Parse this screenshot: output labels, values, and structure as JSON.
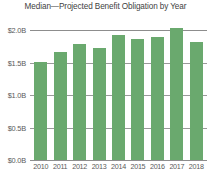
{
  "chart_data": {
    "type": "bar",
    "title": "Median—Projected Benefit Obligation by Year",
    "xlabel": "",
    "ylabel": "",
    "categories": [
      "2010",
      "2011",
      "2012",
      "2013",
      "2014",
      "2015",
      "2016",
      "2017",
      "2018"
    ],
    "values": [
      1.51,
      1.66,
      1.78,
      1.72,
      1.92,
      1.86,
      1.9,
      2.03,
      1.81
    ],
    "value_unit": "B",
    "value_prefix": "$",
    "ylim": [
      0.0,
      2.0
    ],
    "yticks": [
      0.0,
      0.5,
      1.0,
      1.5,
      2.0
    ],
    "ytick_labels": [
      "$0.0B",
      "$0.5B",
      "$1.0B",
      "$1.5B",
      "$2.0B"
    ],
    "grid": true,
    "legend": false,
    "series": [
      {
        "name": "Projected Benefit Obligation",
        "color": "#6aa96e",
        "values": [
          1.51,
          1.66,
          1.78,
          1.72,
          1.92,
          1.86,
          1.9,
          2.03,
          1.81
        ]
      }
    ]
  },
  "colors": {
    "bar": "#6aa96e",
    "grid": "#9a9a9a",
    "axis": "#8d8d8d",
    "text": "#5a5a5a",
    "title": "#3f3f3f",
    "background": "#ffffff"
  }
}
